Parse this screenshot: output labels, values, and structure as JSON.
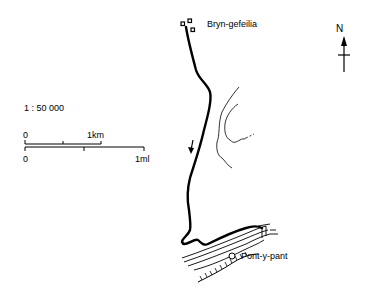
{
  "map": {
    "places": [
      {
        "name": "Bryn-gefeilia"
      },
      {
        "name": "Pont-y-pant"
      }
    ],
    "north_label": "N",
    "scale": {
      "ratio": "1 : 50 000",
      "km_bar": {
        "start": "0",
        "end": "1km"
      },
      "mile_bar": {
        "start": "0",
        "end": "1ml"
      }
    },
    "colors": {
      "ink": "#000000",
      "background": "#ffffff"
    }
  }
}
